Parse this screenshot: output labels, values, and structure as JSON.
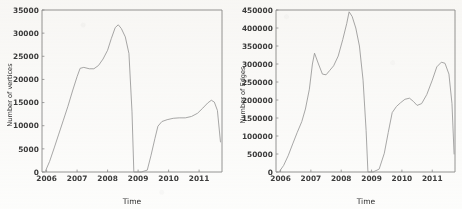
{
  "figure": {
    "title": "",
    "background_color": "#fdfdfc",
    "line_color": "#9a9a9a",
    "axis_color": "#8a8a8a",
    "text_color": "#3c3c3c"
  },
  "chart_data": [
    {
      "type": "line",
      "panel": "left",
      "title": "",
      "xlabel": "Time",
      "ylabel": "Number of vertices",
      "xlim": [
        2005.85,
        2011.75
      ],
      "ylim": [
        0,
        35000
      ],
      "grid": false,
      "legend": null,
      "xticks": [
        2006,
        2007,
        2008,
        2009,
        2010,
        2011
      ],
      "xticklabels": [
        "2006",
        "2007",
        "2008",
        "2009",
        "2010",
        "2011"
      ],
      "yticks": [
        0,
        5000,
        10000,
        15000,
        20000,
        25000,
        30000,
        35000
      ],
      "yticklabels": [
        "0",
        "5000",
        "10000",
        "15000",
        "20000",
        "25000",
        "30000",
        "35000"
      ],
      "series": [
        {
          "name": "vertices",
          "x": [
            2005.95,
            2006.1,
            2006.25,
            2006.4,
            2006.55,
            2006.7,
            2006.85,
            2007.0,
            2007.1,
            2007.22,
            2007.4,
            2007.55,
            2007.7,
            2007.85,
            2008.0,
            2008.12,
            2008.25,
            2008.35,
            2008.45,
            2008.58,
            2008.7,
            2008.8,
            2008.86,
            2009.1,
            2009.3,
            2009.42,
            2009.55,
            2009.65,
            2009.78,
            2009.95,
            2010.15,
            2010.35,
            2010.55,
            2010.75,
            2010.95,
            2011.12,
            2011.28,
            2011.4,
            2011.5,
            2011.6,
            2011.7
          ],
          "y": [
            0,
            2300,
            5200,
            8200,
            11200,
            14200,
            17500,
            20600,
            22400,
            22600,
            22300,
            22300,
            23000,
            24400,
            26300,
            28800,
            31200,
            31800,
            31000,
            29200,
            25600,
            13000,
            0,
            0,
            400,
            3500,
            7200,
            9900,
            10900,
            11300,
            11600,
            11700,
            11700,
            12000,
            12700,
            13800,
            14900,
            15500,
            15100,
            13300,
            6500
          ]
        }
      ]
    },
    {
      "type": "line",
      "panel": "right",
      "title": "",
      "xlabel": "Time",
      "ylabel": "Number of Edges",
      "xlim": [
        2005.85,
        2011.75
      ],
      "ylim": [
        0,
        450000
      ],
      "grid": false,
      "legend": null,
      "xticks": [
        2006,
        2007,
        2008,
        2009,
        2010,
        2011
      ],
      "xticklabels": [
        "2006",
        "2007",
        "2008",
        "2009",
        "2010",
        "2011"
      ],
      "yticks": [
        0,
        50000,
        100000,
        150000,
        200000,
        250000,
        300000,
        350000,
        400000,
        450000
      ],
      "yticklabels": [
        "0",
        "50000",
        "100000",
        "150000",
        "200000",
        "250000",
        "300000",
        "350000",
        "400000",
        "450000"
      ],
      "series": [
        {
          "name": "edges",
          "x": [
            2005.95,
            2006.1,
            2006.25,
            2006.4,
            2006.55,
            2006.7,
            2006.82,
            2006.95,
            2007.05,
            2007.12,
            2007.25,
            2007.38,
            2007.5,
            2007.62,
            2007.75,
            2007.9,
            2008.05,
            2008.18,
            2008.26,
            2008.36,
            2008.48,
            2008.6,
            2008.72,
            2008.82,
            2008.88,
            2009.05,
            2009.25,
            2009.42,
            2009.55,
            2009.68,
            2009.82,
            2009.95,
            2010.1,
            2010.25,
            2010.38,
            2010.5,
            2010.65,
            2010.82,
            2011.0,
            2011.15,
            2011.3,
            2011.42,
            2011.55,
            2011.65,
            2011.72
          ],
          "y": [
            0,
            18000,
            45000,
            78000,
            110000,
            140000,
            175000,
            230000,
            300000,
            330000,
            300000,
            272000,
            270000,
            282000,
            295000,
            322000,
            368000,
            412000,
            445000,
            432000,
            400000,
            350000,
            255000,
            115000,
            0,
            0,
            8000,
            52000,
            110000,
            165000,
            182000,
            192000,
            202000,
            205000,
            196000,
            185000,
            190000,
            215000,
            255000,
            292000,
            305000,
            302000,
            272000,
            190000,
            50000
          ]
        }
      ]
    }
  ]
}
